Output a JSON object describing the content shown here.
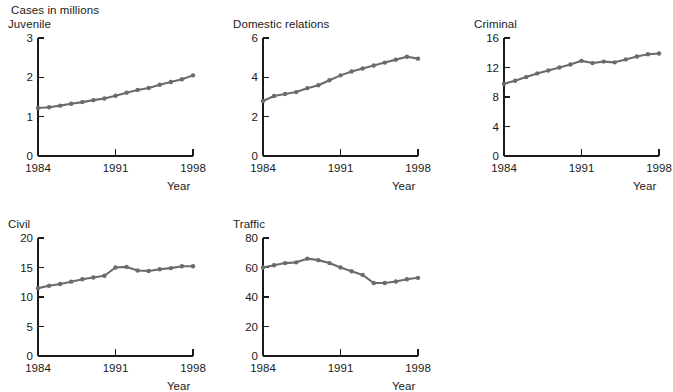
{
  "header": {
    "super_title": "Cases in millions"
  },
  "axis": {
    "xlabel": "Year",
    "xticks": [
      "1984",
      "1991",
      "1998"
    ],
    "xtick_values": [
      1984,
      1991,
      1998
    ]
  },
  "colors": {
    "line": "#6b6b6b",
    "axis": "#1a1a1a",
    "background": "#ffffff",
    "text": "#1a1a1a"
  },
  "chart_data": [
    {
      "type": "line",
      "title": "Juvenile",
      "xlabel": "Year",
      "ylabel": "",
      "xlim": [
        1984,
        1998
      ],
      "ylim": [
        0,
        3
      ],
      "yticks": [
        0,
        1,
        2,
        3
      ],
      "ytick_labels": [
        "0",
        "1",
        "2",
        "3"
      ],
      "grid": false,
      "legend": "none",
      "x": [
        1984,
        1985,
        1986,
        1987,
        1988,
        1989,
        1990,
        1991,
        1992,
        1993,
        1994,
        1995,
        1996,
        1997,
        1998
      ],
      "values": [
        1.22,
        1.24,
        1.28,
        1.33,
        1.37,
        1.42,
        1.46,
        1.53,
        1.61,
        1.68,
        1.73,
        1.81,
        1.88,
        1.95,
        2.05
      ]
    },
    {
      "type": "line",
      "title": "Domestic relations",
      "xlabel": "Year",
      "ylabel": "",
      "xlim": [
        1984,
        1998
      ],
      "ylim": [
        0,
        6
      ],
      "yticks": [
        0,
        2,
        4,
        6
      ],
      "ytick_labels": [
        "0",
        "2",
        "4",
        "6"
      ],
      "grid": false,
      "legend": "none",
      "x": [
        1984,
        1985,
        1986,
        1987,
        1988,
        1989,
        1990,
        1991,
        1992,
        1993,
        1994,
        1995,
        1996,
        1997,
        1998
      ],
      "values": [
        2.8,
        3.05,
        3.15,
        3.25,
        3.45,
        3.6,
        3.85,
        4.1,
        4.3,
        4.45,
        4.6,
        4.75,
        4.9,
        5.05,
        4.95
      ]
    },
    {
      "type": "line",
      "title": "Criminal",
      "xlabel": "Year",
      "ylabel": "",
      "xlim": [
        1984,
        1998
      ],
      "ylim": [
        0,
        16
      ],
      "yticks": [
        0,
        4,
        8,
        12,
        16
      ],
      "ytick_labels": [
        "0",
        "4",
        "8",
        "12",
        "16"
      ],
      "grid": false,
      "legend": "none",
      "x": [
        1984,
        1985,
        1986,
        1987,
        1988,
        1989,
        1990,
        1991,
        1992,
        1993,
        1994,
        1995,
        1996,
        1997,
        1998
      ],
      "values": [
        9.8,
        10.2,
        10.7,
        11.2,
        11.6,
        12.0,
        12.4,
        12.9,
        12.6,
        12.8,
        12.7,
        13.1,
        13.5,
        13.8,
        13.9
      ]
    },
    {
      "type": "line",
      "title": "Civil",
      "xlabel": "Year",
      "ylabel": "",
      "xlim": [
        1984,
        1998
      ],
      "ylim": [
        0,
        20
      ],
      "yticks": [
        0,
        5,
        10,
        15,
        20
      ],
      "ytick_labels": [
        "0",
        "5",
        "10",
        "15",
        "20"
      ],
      "grid": false,
      "legend": "none",
      "x": [
        1984,
        1985,
        1986,
        1987,
        1988,
        1989,
        1990,
        1991,
        1992,
        1993,
        1994,
        1995,
        1996,
        1997,
        1998
      ],
      "values": [
        11.5,
        11.9,
        12.2,
        12.6,
        13.0,
        13.3,
        13.6,
        15.0,
        15.1,
        14.5,
        14.4,
        14.7,
        14.9,
        15.2,
        15.2
      ]
    },
    {
      "type": "line",
      "title": "Traffic",
      "xlabel": "Year",
      "ylabel": "",
      "xlim": [
        1984,
        1998
      ],
      "ylim": [
        0,
        80
      ],
      "yticks": [
        0,
        20,
        40,
        60,
        80
      ],
      "ytick_labels": [
        "0",
        "20",
        "40",
        "60",
        "80"
      ],
      "grid": false,
      "legend": "none",
      "x": [
        1984,
        1985,
        1986,
        1987,
        1988,
        1989,
        1990,
        1991,
        1992,
        1993,
        1994,
        1995,
        1996,
        1997,
        1998
      ],
      "values": [
        60.0,
        61.5,
        63.0,
        63.5,
        66.0,
        65.0,
        63.0,
        60.0,
        57.5,
        55.0,
        49.5,
        49.5,
        50.5,
        52.0,
        53.0
      ]
    }
  ],
  "panels": [
    {
      "id": "juvenile",
      "left": 8,
      "top": 18
    },
    {
      "id": "domestic-relations",
      "left": 233,
      "top": 18
    },
    {
      "id": "criminal",
      "left": 474,
      "top": 18
    },
    {
      "id": "civil",
      "left": 8,
      "top": 218
    },
    {
      "id": "traffic",
      "left": 233,
      "top": 218
    }
  ]
}
